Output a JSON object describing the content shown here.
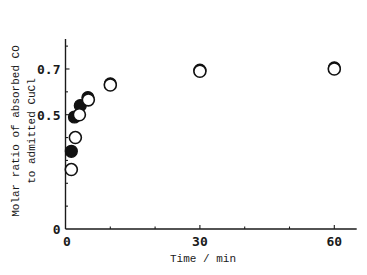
{
  "chart_data": {
    "type": "scatter",
    "title": "",
    "xlabel": "Time / min",
    "ylabel": [
      "Molar ratio of absorbed CO",
      "to admitted CuCl"
    ],
    "xlim": [
      0,
      65
    ],
    "ylim": [
      0,
      0.83
    ],
    "x_ticks": [
      0,
      30,
      60
    ],
    "x_tick_labels": [
      "0",
      "30",
      "60"
    ],
    "x_minor_ticks": [
      10,
      20,
      40,
      50
    ],
    "y_ticks": [
      0,
      0.5,
      0.7
    ],
    "y_tick_labels": [
      "0",
      "0.5",
      "0.7"
    ],
    "y_minor_ticks": [
      0.1,
      0.2,
      0.3,
      0.4,
      0.6,
      0.8
    ],
    "grid": false,
    "legend": null,
    "series": [
      {
        "name": "filled circles",
        "marker": "filled-circle",
        "color": "#111111",
        "x": [
          1.3,
          2.0,
          3.3,
          5.0,
          10.0,
          30.0,
          60.0
        ],
        "y": [
          0.34,
          0.49,
          0.54,
          0.575,
          0.635,
          0.695,
          0.705
        ]
      },
      {
        "name": "open circles",
        "marker": "open-circle",
        "color": "#111111",
        "x": [
          1.3,
          2.2,
          3.1,
          5.1,
          10.0,
          30.0,
          60.0
        ],
        "y": [
          0.26,
          0.4,
          0.5,
          0.565,
          0.63,
          0.69,
          0.7
        ]
      }
    ]
  }
}
